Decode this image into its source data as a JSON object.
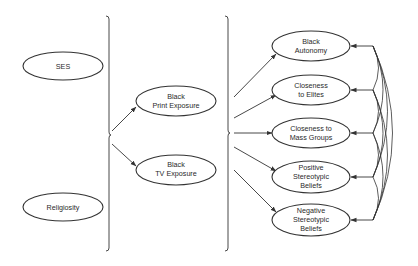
{
  "diagram": {
    "exogenous": [
      {
        "id": "ses",
        "lines": [
          "SES"
        ]
      },
      {
        "id": "religiosity",
        "lines": [
          "Religiosity"
        ]
      }
    ],
    "mediators": [
      {
        "id": "print",
        "lines": [
          "Black",
          "Print Exposure"
        ]
      },
      {
        "id": "tv",
        "lines": [
          "Black",
          "TV Exposure"
        ]
      }
    ],
    "outcomes": [
      {
        "id": "autonomy",
        "lines": [
          "Black",
          "Autonomy"
        ]
      },
      {
        "id": "elites",
        "lines": [
          "Closeness",
          "to Elites"
        ]
      },
      {
        "id": "mass",
        "lines": [
          "Closeness to",
          "Mass Groups"
        ]
      },
      {
        "id": "positive",
        "lines": [
          "Positive",
          "Stereotypic",
          "Beliefs"
        ]
      },
      {
        "id": "negative",
        "lines": [
          "Negative",
          "Stereotypic",
          "Beliefs"
        ]
      }
    ],
    "edges": [
      {
        "from": "exogenous-brace",
        "to": "print"
      },
      {
        "from": "exogenous-brace",
        "to": "tv"
      },
      {
        "from": "mediator-brace",
        "to": "autonomy"
      },
      {
        "from": "mediator-brace",
        "to": "elites"
      },
      {
        "from": "mediator-brace",
        "to": "mass"
      },
      {
        "from": "mediator-brace",
        "to": "positive"
      },
      {
        "from": "mediator-brace",
        "to": "negative"
      }
    ],
    "correlations": "all outcome pairs correlated (curved double-headed arcs)"
  }
}
